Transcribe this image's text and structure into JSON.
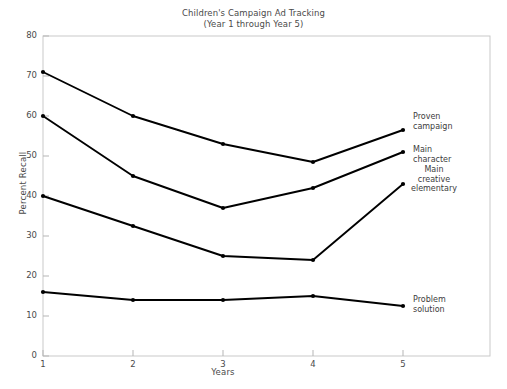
{
  "chart_data": {
    "type": "line",
    "title": "Children's Campaign Ad Tracking",
    "subtitle": "(Year 1 through Year 5)",
    "xlabel": "Years",
    "ylabel": "Percent Recall",
    "categories": [
      "1",
      "2",
      "3",
      "4",
      "5"
    ],
    "x": [
      1,
      2,
      3,
      4,
      5
    ],
    "xlim": [
      1,
      5
    ],
    "ylim": [
      0,
      80
    ],
    "yticks": [
      "0",
      "10",
      "20",
      "30",
      "40",
      "50",
      "60",
      "70",
      "80"
    ],
    "xticks": [
      "1",
      "2",
      "3",
      "4",
      "5"
    ],
    "grid": false,
    "legend_position": "right-inline-labels",
    "marker": "filled-circle",
    "line_color": "#000000",
    "series": [
      {
        "name": "Proven campaign",
        "label_lines": [
          "Proven",
          "campaign"
        ],
        "values": [
          71,
          60,
          53,
          48.5,
          56.5
        ]
      },
      {
        "name": "Main character",
        "label_lines": [
          "Main",
          "character"
        ],
        "values": [
          60,
          45,
          37,
          42,
          51
        ]
      },
      {
        "name": "Main creative elementary",
        "label_lines": [
          "Main",
          "creative",
          "elementary"
        ],
        "values": [
          40,
          32.5,
          25,
          24,
          43
        ]
      },
      {
        "name": "Problem solution",
        "label_lines": [
          "Problem",
          "solution"
        ],
        "values": [
          16,
          14,
          14,
          15,
          12.5
        ]
      }
    ]
  }
}
